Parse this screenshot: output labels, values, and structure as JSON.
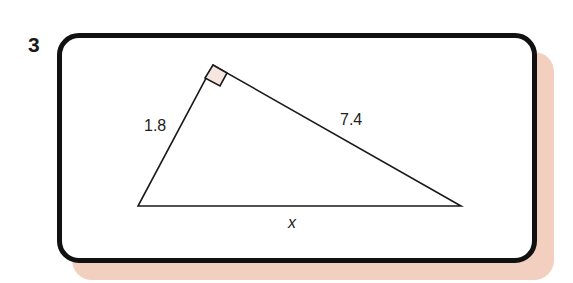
{
  "question": {
    "number": "3"
  },
  "colors": {
    "shadow": "#f3cfc0",
    "outline": "#111111",
    "right_angle_fill": "#f7e6df"
  },
  "triangle": {
    "right_angle_at": "top vertex",
    "sides": [
      {
        "name": "left-leg",
        "label": "1.8"
      },
      {
        "name": "right-leg",
        "label": "7.4"
      },
      {
        "name": "hypotenuse",
        "label": "x"
      }
    ]
  }
}
